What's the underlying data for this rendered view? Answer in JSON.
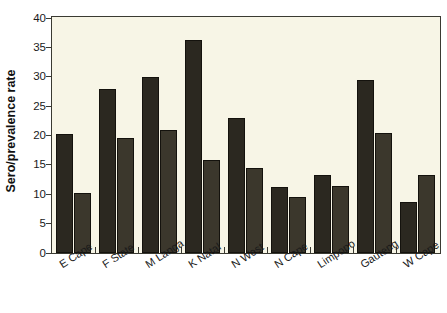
{
  "chart_data": {
    "type": "bar",
    "title": "",
    "xlabel": "",
    "ylabel": "Sero/prevalence rate",
    "ylim": [
      0,
      40
    ],
    "yticks": [
      0,
      5,
      10,
      15,
      20,
      25,
      30,
      35,
      40
    ],
    "grid": false,
    "legend": "none",
    "categories": [
      "E Cape",
      "F State",
      "M Langa",
      "K Natal",
      "N West",
      "N Cape",
      "Limpopo",
      "Gauteng",
      "W Cape"
    ],
    "series": [
      {
        "name": "Series 1",
        "values": [
          20.3,
          28.0,
          29.9,
          36.3,
          23.0,
          11.2,
          13.2,
          29.5,
          8.7
        ]
      },
      {
        "name": "Series 2",
        "values": [
          10.3,
          19.5,
          21.0,
          15.8,
          14.4,
          9.6,
          11.4,
          20.4,
          13.2
        ]
      }
    ],
    "colors": {
      "series_1": "#2b2820",
      "series_2": "#3b372c",
      "plot_background": "#f7f5e6",
      "axis": "#3a3a32",
      "text": "#1a1a1a"
    }
  }
}
